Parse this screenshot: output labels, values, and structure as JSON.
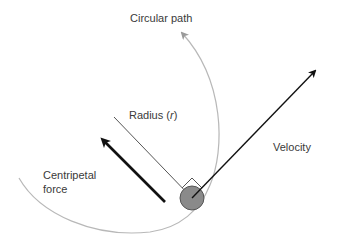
{
  "diagram": {
    "labels": {
      "circular_path": "Circular path",
      "radius_prefix": "Radius (",
      "radius_symbol": "r",
      "radius_suffix": ")",
      "velocity": "Velocity",
      "centripetal_line1": "Centripetal",
      "centripetal_line2": "force"
    },
    "colors": {
      "path": "#b8b8b8",
      "arrow": "#111111",
      "radius_line": "#555555",
      "ball_fill": "#8a8a8a",
      "ball_stroke": "#555555",
      "text": "#3a3a3a"
    }
  }
}
